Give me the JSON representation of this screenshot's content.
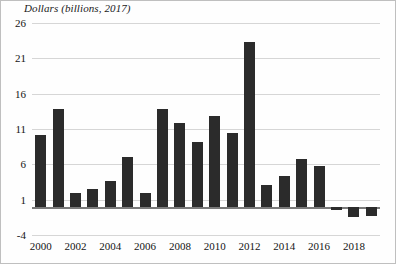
{
  "chart_data": {
    "type": "bar",
    "title": "Dollars (billions, 2017)",
    "ylabel": "Dollars (billions, 2017)",
    "xlabel": "",
    "categories": [
      "2000",
      "2001",
      "2002",
      "2003",
      "2004",
      "2005",
      "2006",
      "2007",
      "2008",
      "2009",
      "2010",
      "2011",
      "2012",
      "2013",
      "2014",
      "2015",
      "2016",
      "2017",
      "2018",
      "2019"
    ],
    "values": [
      10.2,
      13.8,
      1.9,
      2.5,
      3.6,
      7.0,
      1.9,
      13.8,
      11.8,
      9.2,
      12.8,
      10.5,
      23.3,
      3.1,
      4.3,
      6.7,
      5.7,
      -0.4,
      -1.4,
      -1.3
    ],
    "ylim": [
      -4,
      26
    ],
    "yticks": [
      -4,
      1,
      6,
      11,
      16,
      21,
      26
    ],
    "ytick_labels": [
      "-4",
      "1",
      "6",
      "11",
      "16",
      "21",
      "26"
    ],
    "xtick_labels": [
      "2000",
      "2002",
      "2004",
      "2006",
      "2008",
      "2010",
      "2012",
      "2014",
      "2016",
      "2018"
    ],
    "grid": true,
    "legend": false,
    "bar_color": "#2b2b2b",
    "grid_color": "#d6d6d6",
    "axis_color": "#7a7a7a"
  }
}
